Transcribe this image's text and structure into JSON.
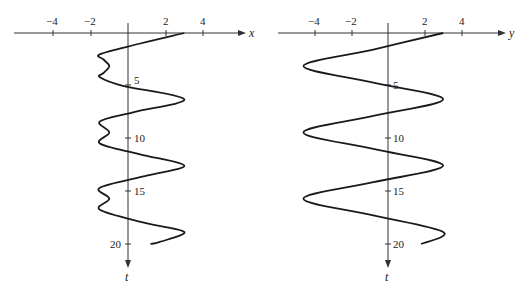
{
  "chart_data": [
    {
      "type": "line",
      "title": "",
      "xlabel": "x",
      "ylabel": "t",
      "orientation": "t-vertical-downward",
      "x_ticks": [
        -4,
        -2,
        2,
        4
      ],
      "t_ticks": [
        5,
        10,
        15,
        20
      ],
      "xlim": [
        -6.8,
        6.2
      ],
      "tlim": [
        0,
        22
      ],
      "grid": false,
      "legend": null,
      "formula_estimate": "x = 2cos(t) + cos(2t)",
      "series": [
        {
          "name": "x(t)",
          "t": [
            0,
            1,
            2,
            2.5,
            3.14,
            3.8,
            4.19,
            5,
            6.28,
            7.5,
            8.38,
            9.42,
            10.47,
            11.5,
            12.57,
            13.5,
            14.66,
            15.71,
            16.76,
            18,
            18.85,
            19.8,
            20
          ],
          "values": [
            3,
            0.66,
            -1.48,
            -1.31,
            -1.0,
            -1.31,
            -1.5,
            -0.27,
            3,
            0.32,
            -1.5,
            -1.0,
            -1.5,
            0.64,
            3,
            1.05,
            -1.5,
            -1.0,
            -1.5,
            0.9,
            3,
            1.7,
            1.2
          ]
        }
      ]
    },
    {
      "type": "line",
      "title": "",
      "xlabel": "y",
      "ylabel": "t",
      "orientation": "t-vertical-downward",
      "x_ticks": [
        -4,
        -2,
        2,
        4
      ],
      "t_ticks": [
        5,
        10,
        15,
        20
      ],
      "xlim": [
        -6.5,
        6.5
      ],
      "tlim": [
        0,
        22
      ],
      "grid": false,
      "legend": null,
      "formula_estimate": "y ≈ 3.8cos(t) − 0.8",
      "series": [
        {
          "name": "y(t)",
          "t": [
            0,
            1.57,
            3.14,
            4.71,
            6.28,
            7.85,
            9.42,
            10.99,
            12.57,
            14.14,
            15.71,
            17.28,
            18.85,
            20
          ],
          "values": [
            3,
            -0.8,
            -4.6,
            -0.8,
            3,
            -0.8,
            -4.6,
            -0.8,
            3,
            -0.8,
            -4.6,
            -0.8,
            3,
            1.8
          ]
        }
      ]
    }
  ],
  "panels": {
    "left": {
      "axis_label_x": "x",
      "axis_label_t": "t",
      "tick_labels_x": [
        "−4",
        "−2",
        "2",
        "4"
      ],
      "tick_labels_t": [
        "5",
        "10",
        "15",
        "20"
      ]
    },
    "right": {
      "axis_label_x": "y",
      "axis_label_t": "t",
      "tick_labels_x": [
        "−4",
        "−2",
        "2",
        "4"
      ],
      "tick_labels_t": [
        "5",
        "10",
        "15",
        "20"
      ]
    }
  }
}
